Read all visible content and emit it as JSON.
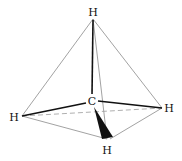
{
  "diagram": {
    "type": "tetrahedral-molecule",
    "molecule": "methane",
    "colors": {
      "bond": "#111111",
      "edge": "#8a8a8a",
      "dashed": "#9a9a9a",
      "background": "#ffffff"
    },
    "atoms": {
      "center": {
        "label": "C",
        "x": 92,
        "y": 101
      },
      "top": {
        "label": "H",
        "x": 93,
        "y": 12
      },
      "left": {
        "label": "H",
        "x": 14,
        "y": 117
      },
      "right": {
        "label": "H",
        "x": 169,
        "y": 108
      },
      "bottom": {
        "label": "H",
        "x": 107,
        "y": 151
      }
    }
  }
}
